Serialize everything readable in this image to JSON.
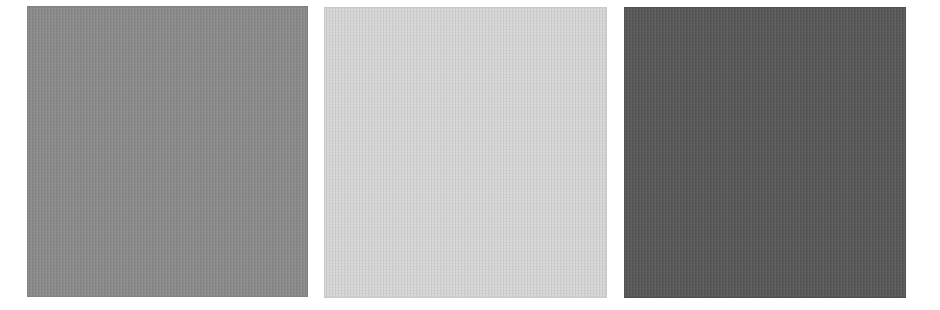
{
  "swatches": [
    {
      "name": "mid-gray",
      "color": "#8a8a8a"
    },
    {
      "name": "light-gray",
      "color": "#d6d6d6"
    },
    {
      "name": "dark-gray",
      "color": "#575757"
    }
  ]
}
